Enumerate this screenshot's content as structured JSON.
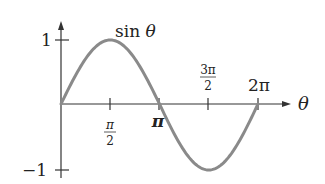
{
  "chart_data": {
    "type": "line",
    "title": "sin θ",
    "xlabel": "θ",
    "ylabel": "",
    "x_ticks": [
      {
        "value": 1.5708,
        "label_num": "π",
        "label_den": "2",
        "position": "below"
      },
      {
        "value": 3.1416,
        "label": "π",
        "position": "below"
      },
      {
        "value": 4.7124,
        "label_num": "3π",
        "label_den": "2",
        "position": "above"
      },
      {
        "value": 6.2832,
        "label": "2π",
        "position": "above"
      }
    ],
    "y_ticks": [
      {
        "value": 1,
        "label": "1"
      },
      {
        "value": -1,
        "label": "−1"
      }
    ],
    "xlim": [
      0,
      6.2832
    ],
    "ylim": [
      -1,
      1
    ],
    "grid": false,
    "series": [
      {
        "name": "sin θ",
        "function": "sin",
        "x": [
          0,
          0.7854,
          1.5708,
          2.3562,
          3.1416,
          3.927,
          4.7124,
          5.4978,
          6.2832
        ],
        "values": [
          0,
          0.707,
          1,
          0.707,
          0,
          -0.707,
          -1,
          -0.707,
          0
        ],
        "color": "#8a8a8a"
      }
    ],
    "curve_label": "sin θ"
  },
  "labels": {
    "curve": "sin θ",
    "x_axis": "θ",
    "y_one": "1",
    "y_neg_one": "−1",
    "pi": "π",
    "two_pi": "2π",
    "pi_over_2_num": "π",
    "pi_over_2_den": "2",
    "three_pi_over_2_num": "3π",
    "three_pi_over_2_den": "2"
  },
  "colors": {
    "curve": "#8a8a8a",
    "axis": "#333333"
  }
}
